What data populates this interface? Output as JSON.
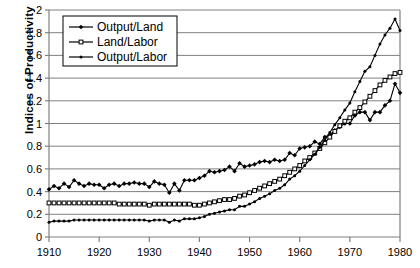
{
  "chart_data": {
    "type": "line",
    "title": "",
    "xlabel": "",
    "ylabel": "Indices of Productivity",
    "xlim": [
      1910,
      1980
    ],
    "ylim": [
      0,
      2
    ],
    "xticks": [
      1910,
      1920,
      1930,
      1940,
      1950,
      1960,
      1970,
      1980
    ],
    "xtick_labels": [
      "1910",
      "1920",
      "1930",
      "1940",
      "1950",
      "1960",
      "1970",
      "1980"
    ],
    "yticks": [
      0,
      0.2,
      0.4,
      0.6,
      0.8,
      1,
      1.2,
      1.4,
      1.6,
      1.8,
      2
    ],
    "ytick_labels": [
      "0",
      "0.2",
      "0.4",
      "0.6",
      "0.8",
      "1",
      "1.2",
      "1.4",
      "1.6",
      "1.8",
      "2"
    ],
    "grid": "horizontal",
    "legend_position": "top-left",
    "x": [
      1910,
      1911,
      1912,
      1913,
      1914,
      1915,
      1916,
      1917,
      1918,
      1919,
      1920,
      1921,
      1922,
      1923,
      1924,
      1925,
      1926,
      1927,
      1928,
      1929,
      1930,
      1931,
      1932,
      1933,
      1934,
      1935,
      1936,
      1937,
      1938,
      1939,
      1940,
      1941,
      1942,
      1943,
      1944,
      1945,
      1946,
      1947,
      1948,
      1949,
      1950,
      1951,
      1952,
      1953,
      1954,
      1955,
      1956,
      1957,
      1958,
      1959,
      1960,
      1961,
      1962,
      1963,
      1964,
      1965,
      1966,
      1967,
      1968,
      1969,
      1970,
      1971,
      1972,
      1973,
      1974,
      1975,
      1976,
      1977,
      1978,
      1979,
      1980
    ],
    "series": [
      {
        "name": "Output/Land",
        "marker": "filled-diamond",
        "values": [
          0.42,
          0.45,
          0.43,
          0.47,
          0.44,
          0.5,
          0.47,
          0.45,
          0.47,
          0.46,
          0.46,
          0.43,
          0.46,
          0.47,
          0.45,
          0.47,
          0.47,
          0.48,
          0.47,
          0.47,
          0.44,
          0.49,
          0.47,
          0.46,
          0.39,
          0.47,
          0.41,
          0.5,
          0.5,
          0.5,
          0.52,
          0.54,
          0.58,
          0.57,
          0.58,
          0.59,
          0.62,
          0.58,
          0.65,
          0.62,
          0.63,
          0.64,
          0.66,
          0.67,
          0.66,
          0.68,
          0.67,
          0.68,
          0.74,
          0.72,
          0.78,
          0.79,
          0.8,
          0.84,
          0.82,
          0.88,
          0.9,
          0.94,
          0.97,
          1.0,
          1.0,
          1.07,
          1.1,
          1.1,
          1.03,
          1.1,
          1.1,
          1.16,
          1.2,
          1.35,
          1.27
        ]
      },
      {
        "name": "Land/Labor",
        "marker": "open-square",
        "values": [
          0.3,
          0.3,
          0.3,
          0.3,
          0.3,
          0.3,
          0.3,
          0.3,
          0.3,
          0.3,
          0.3,
          0.3,
          0.3,
          0.3,
          0.29,
          0.29,
          0.29,
          0.29,
          0.29,
          0.29,
          0.28,
          0.29,
          0.29,
          0.29,
          0.29,
          0.29,
          0.29,
          0.29,
          0.29,
          0.28,
          0.28,
          0.29,
          0.3,
          0.31,
          0.32,
          0.33,
          0.33,
          0.34,
          0.36,
          0.37,
          0.39,
          0.41,
          0.43,
          0.45,
          0.47,
          0.49,
          0.51,
          0.54,
          0.57,
          0.6,
          0.63,
          0.67,
          0.7,
          0.74,
          0.78,
          0.83,
          0.88,
          0.93,
          0.98,
          1.02,
          1.05,
          1.1,
          1.14,
          1.19,
          1.24,
          1.29,
          1.34,
          1.38,
          1.41,
          1.44,
          1.45
        ]
      },
      {
        "name": "Output/Labor",
        "marker": "filled-dot",
        "values": [
          0.13,
          0.14,
          0.14,
          0.14,
          0.14,
          0.15,
          0.15,
          0.15,
          0.15,
          0.15,
          0.15,
          0.15,
          0.15,
          0.15,
          0.15,
          0.15,
          0.15,
          0.15,
          0.15,
          0.15,
          0.14,
          0.15,
          0.15,
          0.15,
          0.13,
          0.15,
          0.14,
          0.16,
          0.16,
          0.16,
          0.17,
          0.18,
          0.2,
          0.21,
          0.22,
          0.23,
          0.24,
          0.24,
          0.27,
          0.27,
          0.29,
          0.31,
          0.34,
          0.36,
          0.38,
          0.41,
          0.43,
          0.46,
          0.51,
          0.54,
          0.58,
          0.63,
          0.68,
          0.73,
          0.79,
          0.85,
          0.92,
          0.99,
          1.05,
          1.12,
          1.18,
          1.28,
          1.37,
          1.46,
          1.5,
          1.6,
          1.7,
          1.78,
          1.84,
          1.92,
          1.82
        ]
      }
    ]
  },
  "legend": {
    "items": [
      {
        "label": "Output/Land"
      },
      {
        "label": "Land/Labor"
      },
      {
        "label": "Output/Labor"
      }
    ]
  },
  "colors": {
    "series": "#000000",
    "grid": "#808080",
    "axis": "#808080",
    "background": "#ffffff"
  }
}
